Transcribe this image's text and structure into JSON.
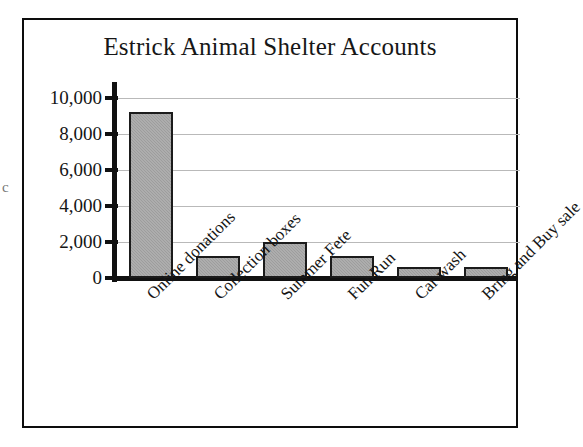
{
  "page": {
    "margin_fragment": "c"
  },
  "chart_data": {
    "type": "bar",
    "title": "Estrick Animal Shelter Accounts",
    "xlabel": "",
    "ylabel": "",
    "categories": [
      "Online donations",
      "Collection boxes",
      "Summer Fete",
      "Fun Run",
      "Car wash",
      "Bring and Buy sale"
    ],
    "values": [
      9200,
      1200,
      2000,
      1200,
      600,
      600
    ],
    "ylim": [
      0,
      11000
    ],
    "yticks": [
      0,
      2000,
      4000,
      6000,
      8000,
      10000
    ],
    "ytick_labels": [
      "0",
      "2,000",
      "4,000",
      "6,000",
      "8,000",
      "10,000"
    ],
    "grid": true,
    "legend": false,
    "colors": {
      "bar_fill": "#9d9d9d",
      "bar_border": "#1b1b1b",
      "gridline": "#b9b9b9",
      "axis": "#111111",
      "frame": "#0d0d0d",
      "text": "#151515",
      "background": "#ffffff"
    }
  }
}
